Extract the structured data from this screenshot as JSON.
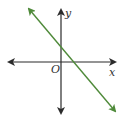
{
  "diagram": {
    "type": "coordinate-plane-line",
    "axes": {
      "x_label": "x",
      "y_label": "y",
      "origin_label": "O",
      "axis_color": "#2b2b2b"
    },
    "line": {
      "color": "#4f8a3a",
      "description": "line with negative slope, positive y-intercept and positive x-intercept",
      "slope_sign": "negative",
      "y_intercept_sign": "positive",
      "x_intercept_sign": "positive"
    }
  }
}
